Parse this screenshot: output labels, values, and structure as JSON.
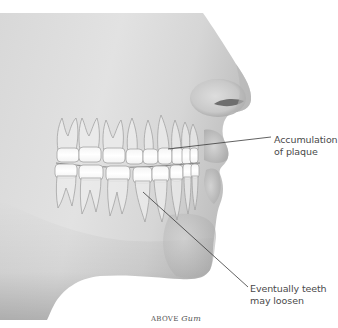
{
  "figure": {
    "colors": {
      "skin_light": "#e6e6e6",
      "skin_mid": "#cfcfcf",
      "skin_dark": "#9a9a9a",
      "tooth_crown": "#ffffff",
      "tooth_root": "#ececec",
      "tooth_outline": "#9c9c9c",
      "leader_line": "#3a3a3a",
      "background": "#ffffff"
    }
  },
  "annotations": [
    {
      "id": "plaque",
      "line1": "Accumulation",
      "line2": "of plaque"
    },
    {
      "id": "loosen",
      "line1": "Eventually teeth",
      "line2": "may loosen"
    }
  ],
  "caption": {
    "prefix": "ABOVE",
    "word": "Gum"
  }
}
